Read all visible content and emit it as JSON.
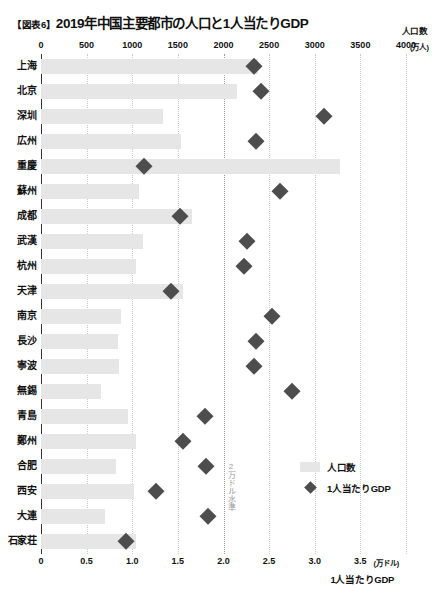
{
  "header": {
    "figure_tag": "【図表6】",
    "title": "2019年中国主要都市の人口と1人当たりGDP"
  },
  "top_axis": {
    "series_label": "人口数",
    "unit": "(万人)",
    "ticks": [
      "0",
      "500",
      "1000",
      "1500",
      "2000",
      "2500",
      "3000",
      "3500",
      "4000"
    ]
  },
  "bottom_axis": {
    "series_label": "1人当たりGDP",
    "unit": "(万ドル)",
    "ticks": [
      "0",
      "0.5",
      "1.0",
      "1.5",
      "2.0",
      "2.5",
      "3.0",
      "3.5"
    ]
  },
  "annotation": {
    "threshold_note": "2万ドル水準"
  },
  "legend": {
    "items": [
      {
        "label": "人口数",
        "marker": "bar-swatch",
        "color": "#e6e6e6"
      },
      {
        "label": "1人当たりGDP",
        "marker": "diamond",
        "color": "#4d4d4d"
      }
    ]
  },
  "chart_data": {
    "type": "bar",
    "title": "2019年中国主要都市の人口と1人当たりGDP",
    "xlabel": "",
    "ylabel": "",
    "grid": true,
    "legend_position": "inside-right",
    "orientation": "horizontal",
    "categories": [
      "上海",
      "北京",
      "深圳",
      "広州",
      "重慶",
      "蘇州",
      "成都",
      "武漢",
      "杭州",
      "天津",
      "南京",
      "長沙",
      "寧波",
      "無錫",
      "青島",
      "鄭州",
      "合肥",
      "西安",
      "大連",
      "石家荘"
    ],
    "series": [
      {
        "name": "人口数",
        "unit": "万人",
        "axis": "top",
        "xlim": [
          0,
          4000
        ],
        "type": "bar",
        "color": "#e6e6e6",
        "values": [
          2380,
          2150,
          1340,
          1530,
          3280,
          1070,
          1660,
          1120,
          1040,
          1560,
          880,
          840,
          850,
          660,
          950,
          1040,
          820,
          1020,
          700,
          1040
        ]
      },
      {
        "name": "1人当たりGDP",
        "unit": "万ドル",
        "axis": "bottom",
        "xlim": [
          0,
          4.0
        ],
        "type": "scatter",
        "marker": "diamond",
        "color": "#4d4d4d",
        "values": [
          2.33,
          2.41,
          3.1,
          2.36,
          1.13,
          2.62,
          1.52,
          2.26,
          2.22,
          1.42,
          2.53,
          2.36,
          2.33,
          2.75,
          1.8,
          1.56,
          1.81,
          1.26,
          1.83,
          0.93
        ]
      }
    ],
    "annotations": [
      {
        "text": "2万ドル水準",
        "x_bottom_axis": 2.0,
        "style": "vertical-dotted-line"
      }
    ]
  }
}
